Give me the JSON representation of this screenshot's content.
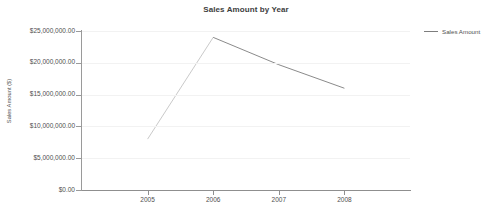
{
  "chart_data": {
    "type": "line",
    "title": "Sales Amount by Year",
    "xlabel": "",
    "ylabel": "Sales Amount ($)",
    "categories": [
      "2005",
      "2006",
      "2007",
      "2008"
    ],
    "x": [
      2005,
      2006,
      2007,
      2008
    ],
    "series": [
      {
        "name": "Sales Amount",
        "values": [
          8000000,
          24000000,
          19700000,
          16000000
        ],
        "color": "#7d7d7d"
      }
    ],
    "ylim": [
      0,
      25000000
    ],
    "xlim": [
      2004.0,
      2009.0
    ],
    "ytick_labels": [
      "$25,000,000.00",
      "$20,000,000.00",
      "$15,000,000.00",
      "$10,000,000.00",
      "$5,000,000.00",
      "$0.00"
    ],
    "ytick_values": [
      25000000,
      20000000,
      15000000,
      10000000,
      5000000,
      0
    ],
    "xtick_labels": [
      "2005",
      "2006",
      "2007",
      "2008"
    ],
    "grid": true,
    "grid_axis": "y",
    "grid_color": "#f2f2f2",
    "legend": {
      "position": "right",
      "entries": [
        {
          "label": "Sales Amount",
          "marker": "line",
          "color": "#7d7d7d"
        }
      ]
    },
    "background_color": "#ffffff",
    "axis_color": "#9a9a9a",
    "text_color": "#4f4f4f"
  }
}
